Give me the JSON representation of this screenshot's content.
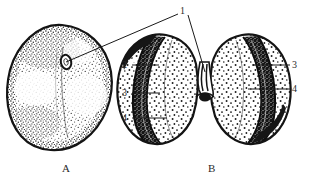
{
  "figure": {
    "kind": "botanical-line-drawing",
    "background_color": "#ffffff",
    "ink_color": "#1a1a1a",
    "panels": [
      {
        "id": "A",
        "caption": "A",
        "caption_x": 62,
        "caption_y": 162,
        "description": "whole seed, rounded outline, stippled coat with small oval hilum"
      },
      {
        "id": "B",
        "caption": "B",
        "caption_x": 208,
        "caption_y": 162,
        "description": "seed split into two cotyledons, each with dark curved embryo band"
      }
    ],
    "callouts": [
      {
        "id": "callout-1",
        "label": "1",
        "label_x": 180,
        "label_y": 6,
        "leaders": [
          {
            "x1": 178,
            "y1": 14,
            "x2": 66,
            "y2": 62
          },
          {
            "x1": 188,
            "y1": 15,
            "x2": 205,
            "y2": 72
          }
        ]
      },
      {
        "id": "callout-2",
        "label": "2",
        "label_x": 122,
        "label_y": 60,
        "leaders": [
          {
            "x1": 132,
            "y1": 65,
            "x2": 159,
            "y2": 65
          }
        ]
      },
      {
        "id": "callout-3-left",
        "label": "3",
        "label_x": 122,
        "label_y": 88,
        "leaders": [
          {
            "x1": 132,
            "y1": 93,
            "x2": 160,
            "y2": 93
          }
        ]
      },
      {
        "id": "callout-4-left",
        "label": "4",
        "label_x": 122,
        "label_y": 113,
        "leaders": [
          {
            "x1": 132,
            "y1": 118,
            "x2": 167,
            "y2": 118
          }
        ]
      },
      {
        "id": "callout-3-right",
        "label": "3",
        "label_x": 292,
        "label_y": 60,
        "leaders": [
          {
            "x1": 290,
            "y1": 65,
            "x2": 252,
            "y2": 65
          }
        ]
      },
      {
        "id": "callout-4-right",
        "label": "4",
        "label_x": 292,
        "label_y": 84,
        "leaders": [
          {
            "x1": 290,
            "y1": 89,
            "x2": 248,
            "y2": 89
          }
        ]
      }
    ]
  }
}
